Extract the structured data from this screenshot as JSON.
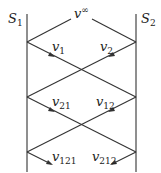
{
  "diagram": {
    "walls": [
      {
        "name": "S",
        "sub": "1"
      },
      {
        "name": "S",
        "sub": "2"
      }
    ],
    "top_label": {
      "base": "v",
      "sup": "∞"
    },
    "velocities": [
      {
        "base": "v",
        "sub": "1"
      },
      {
        "base": "v",
        "sub": "2"
      },
      {
        "base": "v",
        "sub": "21"
      },
      {
        "base": "v",
        "sub": "12"
      },
      {
        "base": "v",
        "sub": "121"
      },
      {
        "base": "v",
        "sub": "212"
      }
    ],
    "line_color": "#333333"
  }
}
